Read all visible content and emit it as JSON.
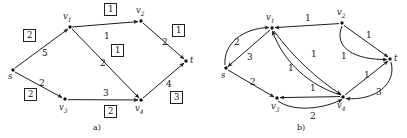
{
  "figure": {
    "width": 407,
    "height": 138,
    "background": "#ffffff",
    "edge_color": "#1b1b1b",
    "node_color": "#111111",
    "panels": [
      {
        "id": "a",
        "caption": "a)",
        "caption_x": 93,
        "caption_y": 124
      },
      {
        "id": "b",
        "caption": "b)",
        "caption_y": 124,
        "caption_x": 297
      }
    ]
  },
  "panel_a": {
    "nodes": [
      {
        "name": "s",
        "label": "s",
        "sub": "",
        "x": 13,
        "y": 70,
        "lx": 8,
        "ly": 72
      },
      {
        "name": "v1",
        "label": "v",
        "sub": "1",
        "x": 70,
        "y": 27,
        "lx": 63,
        "ly": 12
      },
      {
        "name": "v2",
        "label": "v",
        "sub": "2",
        "x": 141,
        "y": 21,
        "lx": 136,
        "ly": 6
      },
      {
        "name": "v3",
        "label": "v",
        "sub": "3",
        "x": 65,
        "y": 99,
        "lx": 59,
        "ly": 103
      },
      {
        "name": "v4",
        "label": "v",
        "sub": "4",
        "x": 141,
        "y": 100,
        "lx": 135,
        "ly": 104
      },
      {
        "name": "t",
        "label": "t",
        "sub": "",
        "x": 186,
        "y": 61,
        "lx": 190,
        "ly": 56
      }
    ],
    "edges": [
      {
        "from": "s",
        "to": "v1",
        "weight": "5",
        "wx": 42,
        "wy": 49
      },
      {
        "from": "v1",
        "to": "v2",
        "weight": "1",
        "wx": 104,
        "wy": 32
      },
      {
        "from": "v1",
        "to": "v4",
        "weight": "2",
        "wx": 100,
        "wy": 59
      },
      {
        "from": "s",
        "to": "v3",
        "weight": "2",
        "wx": 39,
        "wy": 79
      },
      {
        "from": "v3",
        "to": "v4",
        "weight": "3",
        "wx": 103,
        "wy": 89
      },
      {
        "from": "v2",
        "to": "t",
        "weight": "2",
        "wx": 162,
        "wy": 38
      },
      {
        "from": "v4",
        "to": "t",
        "weight": "4",
        "wx": 166,
        "wy": 80
      }
    ],
    "boxed_labels": [
      {
        "value": "2",
        "x": 23,
        "y": 29
      },
      {
        "value": "1",
        "x": 104,
        "y": 3
      },
      {
        "value": "1",
        "x": 172,
        "y": 24
      },
      {
        "value": "1",
        "x": 111,
        "y": 44
      },
      {
        "value": "2",
        "x": 24,
        "y": 88
      },
      {
        "value": "2",
        "x": 104,
        "y": 105
      },
      {
        "value": "3",
        "x": 170,
        "y": 91
      }
    ]
  },
  "panel_b": {
    "nodes": [
      {
        "name": "s",
        "label": "s",
        "sub": "",
        "x": 226,
        "y": 68,
        "lx": 221,
        "ly": 71
      },
      {
        "name": "v1",
        "label": "v",
        "sub": "1",
        "x": 272,
        "y": 28,
        "lx": 266,
        "ly": 13
      },
      {
        "name": "v2",
        "label": "v",
        "sub": "2",
        "x": 342,
        "y": 23,
        "lx": 337,
        "ly": 8
      },
      {
        "name": "v3",
        "label": "v",
        "sub": "3",
        "x": 277,
        "y": 98,
        "lx": 271,
        "ly": 102
      },
      {
        "name": "v4",
        "label": "v",
        "sub": "4",
        "x": 343,
        "y": 97,
        "lx": 337,
        "ly": 101
      },
      {
        "name": "t",
        "label": "t",
        "sub": "",
        "x": 390,
        "y": 59,
        "lx": 394,
        "ly": 54
      }
    ],
    "edges": [
      {
        "from": "s",
        "to": "v1",
        "weight": "2",
        "wx": 234,
        "wy": 38,
        "curved": true
      },
      {
        "from": "v1",
        "to": "s",
        "weight": "3",
        "wx": 247,
        "wy": 53,
        "curved": false
      },
      {
        "from": "v2",
        "to": "v1",
        "weight": "1",
        "wx": 305,
        "wy": 17,
        "curved": false
      },
      {
        "from": "v4",
        "to": "v1",
        "weight": "1",
        "wx": 290,
        "wy": 66,
        "curved": true
      },
      {
        "from": "v1",
        "to": "v4",
        "weight": "1",
        "wx": 310,
        "wy": 52,
        "curved": true
      },
      {
        "from": "v2",
        "to": "t",
        "weight": "1",
        "wx": 366,
        "wy": 33,
        "curved": false
      },
      {
        "from": "v2",
        "to": "t",
        "weight": "1",
        "wx": 341,
        "wy": 53,
        "curved": true
      },
      {
        "from": "s",
        "to": "v3",
        "weight": "2",
        "wx": 250,
        "wy": 80,
        "curved": false
      },
      {
        "from": "v4",
        "to": "v3",
        "weight": "1",
        "wx": 310,
        "wy": 86,
        "curved": false
      },
      {
        "from": "v3",
        "to": "v4",
        "weight": "2",
        "wx": 310,
        "wy": 110,
        "curved": true
      },
      {
        "from": "v4",
        "to": "t",
        "weight": "1",
        "wx": 364,
        "wy": 73,
        "curved": false
      },
      {
        "from": "t",
        "to": "v4",
        "weight": "3",
        "wx": 374,
        "wy": 90,
        "curved": true
      }
    ]
  },
  "graph_data": {
    "type": "directed-weighted-graph-pair",
    "panel_a_title": "a)",
    "panel_b_title": "b)",
    "panel_a_note": "network with edge capacities and boxed flow values",
    "panel_b_note": "residual network with residual capacities"
  }
}
